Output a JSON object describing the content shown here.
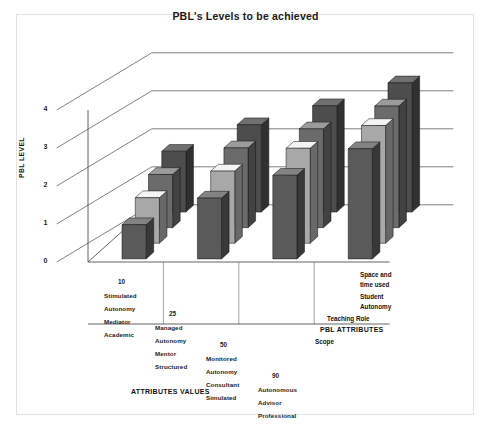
{
  "figure": {
    "title": "PBL's Levels to be achieved",
    "background": "#ffffff",
    "border_color": "#e2e2e2"
  },
  "axes": {
    "y_title": "PBL LEVEL",
    "x_title": "ATTRIBUTES VALUES",
    "z_title": "PBL ATTRIBUTES",
    "y_ticks": [
      "0",
      "1",
      "2",
      "3",
      "4"
    ]
  },
  "groups": [
    {
      "value": "10",
      "lines": [
        "Stimulated",
        "Autonomy",
        "Mediator",
        "Academic"
      ]
    },
    {
      "value": "25",
      "lines": [
        "Managed",
        "Autonomy",
        "Mentor",
        "Structured"
      ]
    },
    {
      "value": "50",
      "lines": [
        "Monitored",
        "Autonomy",
        "Consultant",
        "Simulated"
      ]
    },
    {
      "value": "90",
      "lines": [
        "Autonomous",
        "Advisor",
        "Professional"
      ]
    }
  ],
  "series_labels": [
    {
      "text": "Space and",
      "text2": "time used"
    },
    {
      "text": "Student",
      "text2": "Autonomy"
    },
    {
      "text": "Teaching Role",
      "text2": ""
    },
    {
      "text": "Scope",
      "text2": ""
    }
  ],
  "colors": {
    "series_scope": "#4d4d4d",
    "series_teaching_role": "#6b6b6b",
    "series_student_autonomy": "#a8a8a8",
    "series_space_time": "#5a5a5a",
    "top_tint": "#d9d9d9",
    "side_tint": "#333333",
    "axis": "#3c3c3c"
  },
  "chart_data": {
    "type": "bar",
    "title": "PBL's Levels to be achieved",
    "xlabel": "ATTRIBUTES VALUES",
    "ylabel": "PBL LEVEL",
    "zlabel": "PBL ATTRIBUTES",
    "ylim": [
      0,
      4
    ],
    "grid": false,
    "legend": "right-depth-axis",
    "three_d": true,
    "categories": [
      "10",
      "25",
      "50",
      "90"
    ],
    "category_descriptions": [
      "Stimulated Autonomy / Mediator / Academic",
      "Managed Autonomy / Mentor / Structured",
      "Monitored Autonomy / Consultant / Simulated",
      "Autonomous / Advisor / Professional"
    ],
    "series": [
      {
        "name": "Scope",
        "color": "#4d4d4d",
        "values": [
          1.6,
          2.3,
          2.8,
          3.4
        ]
      },
      {
        "name": "Teaching Role",
        "color": "#6b6b6b",
        "values": [
          1.4,
          2.1,
          2.6,
          3.2
        ]
      },
      {
        "name": "Student Autonomy",
        "color": "#a8a8a8",
        "values": [
          1.2,
          1.9,
          2.5,
          3.1
        ]
      },
      {
        "name": "Space and time used",
        "color": "#5a5a5a",
        "values": [
          0.9,
          1.6,
          2.2,
          2.9
        ]
      }
    ]
  }
}
